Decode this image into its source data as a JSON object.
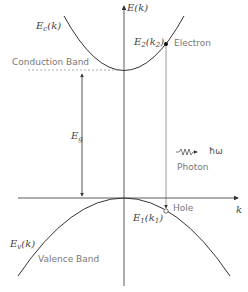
{
  "diagram": {
    "type": "band-diagram",
    "axes": {
      "y_label": "E(k)",
      "x_label": "k"
    },
    "curves": [
      {
        "name": "Conduction band",
        "label_main": "E",
        "label_sub": "c",
        "label_arg": "(k)"
      },
      {
        "name": "Valence band",
        "label_main": "E",
        "label_sub": "v",
        "label_arg": "(k)"
      }
    ],
    "labels": {
      "conduction_band": "Conduction Band",
      "valence_band": "Valence Band",
      "band_gap_main": "E",
      "band_gap_sub": "g",
      "electron": "Electron",
      "hole": "Hole",
      "photon": "Photon",
      "photon_energy": "ħω",
      "e2_main": "E",
      "e2_sub": "2",
      "e2_arg_main": "(k",
      "e2_arg_sub": "2",
      "e2_close": ")",
      "e1_main": "E",
      "e1_sub": "1",
      "e1_arg_main": "(k",
      "e1_arg_sub": "1",
      "e1_close": ")"
    },
    "colors": {
      "line": "#333333",
      "text": "#777777",
      "dashed": "#888888"
    }
  }
}
